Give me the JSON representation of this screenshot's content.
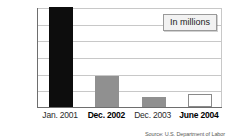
{
  "chart_data": {
    "type": "bar",
    "title": "",
    "subtitle": "",
    "xlabel": "",
    "ylabel": "",
    "legend_note": "In millions",
    "legend_position": "top-right",
    "grid": true,
    "ylim": [
      14.0,
      17.0
    ],
    "yticks": [
      "14.00",
      "14.50",
      "15.00",
      "15.50",
      "16.00",
      "16.50",
      "17.00"
    ],
    "ytick_values": [
      14.0,
      14.5,
      15.0,
      15.5,
      16.0,
      16.5,
      17.0
    ],
    "categories": [
      "Jan. 2001",
      "Dec. 2002",
      "Dec. 2003",
      "June 2004"
    ],
    "values": [
      17.0,
      14.92,
      14.3,
      14.38
    ],
    "bar_styles": [
      {
        "fill": "#0d0d0d",
        "border": "#0d0d0d",
        "emphasis": false
      },
      {
        "fill": "#909090",
        "border": "#909090",
        "emphasis": true
      },
      {
        "fill": "#909090",
        "border": "#909090",
        "emphasis": false
      },
      {
        "fill": "#ffffff",
        "border": "#8a8a8a",
        "emphasis": true
      }
    ],
    "source": "Source: U.S. Department of Labor",
    "colors": {
      "axis": "#6e6e6e",
      "grid": "#c8c8c8",
      "dark_bar": "#0d0d0d",
      "gray_bar": "#909090",
      "open_bar": "#ffffff",
      "text": "#1a1a1a",
      "legend_bg": "#f2f2f2"
    }
  }
}
